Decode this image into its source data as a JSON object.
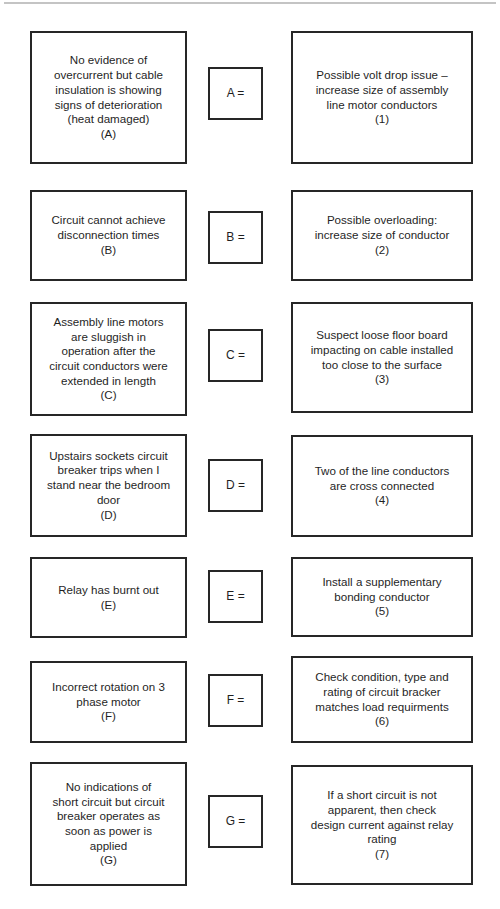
{
  "page": {
    "background_color": "#ffffff",
    "border_color": "#262626",
    "text_color": "#1f1f1f",
    "rule_color": "#c4c4c4"
  },
  "rows": [
    {
      "left": "No evidence of\novercurrent but cable\ninsulation is showing\nsigns of deterioration\n(heat damaged)\n(A)",
      "middle": "A =",
      "right": "Possible volt drop issue –\nincrease size of assembly\nline motor conductors\n(1)"
    },
    {
      "left": "Circuit cannot achieve\ndisconnection times\n(B)",
      "middle": "B =",
      "right": "Possible overloading:\nincrease size of conductor\n(2)"
    },
    {
      "left": "Assembly line motors\nare sluggish in\noperation after the\ncircuit conductors were\nextended in length\n(C)",
      "middle": "C =",
      "right": "Suspect loose floor board\nimpacting on cable installed\ntoo close to the surface\n(3)"
    },
    {
      "left": "Upstairs sockets circuit\nbreaker trips when I\nstand near the bedroom\ndoor\n(D)",
      "middle": "D =",
      "right": "Two of the line conductors\nare cross connected\n(4)"
    },
    {
      "left": "Relay has burnt out\n(E)",
      "middle": "E =",
      "right": "Install a supplementary\nbonding conductor\n(5)"
    },
    {
      "left": "Incorrect rotation on 3\nphase motor\n(F)",
      "middle": "F =",
      "right": "Check condition, type and\nrating of circuit bracker\nmatches load requirments\n(6)"
    },
    {
      "left": "No indications of\nshort circuit but circuit\nbreaker operates as\nsoon as power is\napplied\n(G)",
      "middle": "G =",
      "right": "If a short circuit is not\napparent, then check\ndesign current against relay\nrating\n(7)"
    }
  ]
}
